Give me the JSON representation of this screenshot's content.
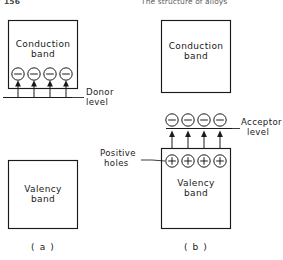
{
  "page": {
    "folio": "156",
    "running_title": "The structure of alloys"
  },
  "figure": {
    "panels": [
      {
        "id": "a",
        "caption": "( a )",
        "conduction_band_label_line1": "Conduction",
        "conduction_band_label_line2": "band",
        "valency_band_label_line1": "Valency",
        "valency_band_label_line2": "band",
        "level_label_line1": "Donor",
        "level_label_line2": "level",
        "carrier_count": 4,
        "carrier_sign": "minus",
        "carrier_location": "inside-conduction-band",
        "arrow_direction": "up",
        "arrow_source": "donor-level"
      },
      {
        "id": "b",
        "caption": "( b )",
        "conduction_band_label_line1": "Conduction",
        "conduction_band_label_line2": "band",
        "valency_band_label_line1": "Valency",
        "valency_band_label_line2": "band",
        "level_label_line1": "Acceptor",
        "level_label_line2": "level",
        "hole_label_line1": "Positive",
        "hole_label_line2": "holes",
        "carrier_count": 4,
        "carrier_sign": "minus",
        "carrier_location": "on-acceptor-level",
        "hole_count": 4,
        "hole_sign": "plus",
        "hole_location": "inside-valency-band",
        "arrow_direction": "up",
        "arrow_source": "valency-band"
      }
    ],
    "colors": {
      "ink": "#1a1a1a",
      "paper": "#ffffff",
      "header_ink": "#5e5e5e"
    }
  }
}
